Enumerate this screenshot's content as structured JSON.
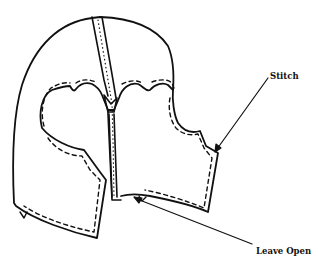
{
  "diagram": {
    "labels": {
      "stitch": "Stitch",
      "leave_open": "Leave Open"
    },
    "colors": {
      "line": "#111111",
      "background": "#ffffff"
    }
  }
}
